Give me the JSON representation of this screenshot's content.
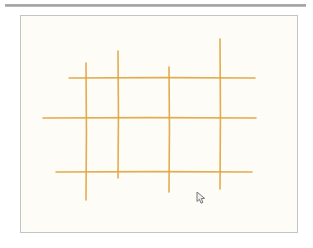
{
  "app": {
    "title": "Drawing Canvas",
    "background_color": "#ffffff"
  },
  "divider": {
    "name": "top-divider",
    "color": "#9a9a9a",
    "x": 5,
    "y": 4,
    "width": 301,
    "height": 3
  },
  "canvas": {
    "label": "Drawing Canvas",
    "x": 20,
    "y": 15,
    "width": 278,
    "height": 218,
    "fill_color": "#fdfcf7",
    "border_color": "#c4c4c4"
  },
  "cursor": {
    "name": "mouse-pointer",
    "x": 199,
    "y": 195,
    "color": "#6b6b6b"
  },
  "chart_data": {
    "type": "line",
    "xlabel": "",
    "ylabel": "",
    "stroke_color": "#e0a540",
    "stroke_width": 1.6,
    "xlim": [
      0,
      276
    ],
    "ylim": [
      0,
      216
    ],
    "grid": false,
    "legend": "none",
    "annotations": [],
    "series": [
      {
        "name": "vertical-line-1",
        "orientation": "vertical",
        "x": [
          65,
          65
        ],
        "y": [
          47,
          184
        ]
      },
      {
        "name": "vertical-line-2",
        "orientation": "vertical",
        "x": [
          97,
          97
        ],
        "y": [
          35,
          162
        ]
      },
      {
        "name": "vertical-line-3",
        "orientation": "vertical",
        "x": [
          148,
          148
        ],
        "y": [
          51,
          176
        ]
      },
      {
        "name": "vertical-line-4",
        "orientation": "vertical",
        "x": [
          199,
          199
        ],
        "y": [
          23,
          173
        ]
      },
      {
        "name": "horizontal-line-1",
        "orientation": "horizontal",
        "x": [
          48,
          234
        ],
        "y": [
          62,
          62
        ]
      },
      {
        "name": "horizontal-line-2",
        "orientation": "horizontal",
        "x": [
          22,
          235
        ],
        "y": [
          102,
          102
        ]
      },
      {
        "name": "horizontal-line-3",
        "orientation": "horizontal",
        "x": [
          35,
          231
        ],
        "y": [
          156,
          156
        ]
      }
    ]
  }
}
